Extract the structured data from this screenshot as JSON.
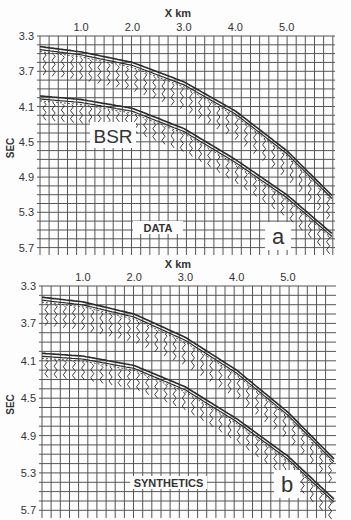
{
  "chart_data": [
    {
      "type": "heatmap",
      "panel_label": "a",
      "annotation": "DATA",
      "feature_label": "BSR",
      "title": "",
      "xlabel": "X km",
      "ylabel": "SEC",
      "x_ticks": [
        "1.0",
        "2.0",
        "3.0",
        "4.0",
        "5.0"
      ],
      "x_tick_values": [
        1.0,
        2.0,
        3.0,
        4.0,
        5.0
      ],
      "y_ticks": [
        "3.3",
        "3.7",
        "4.1",
        "4.5",
        "4.9",
        "5.3",
        "5.7"
      ],
      "y_tick_values": [
        3.3,
        3.7,
        4.1,
        4.5,
        4.9,
        5.3,
        5.7
      ],
      "xlim": [
        0.2,
        5.9
      ],
      "ylim": [
        3.3,
        5.75
      ],
      "grid": true,
      "events": [
        {
          "name": "seafloor reflection",
          "x": [
            0.2,
            1.0,
            2.0,
            3.0,
            4.0,
            5.0,
            5.9
          ],
          "t": [
            3.42,
            3.48,
            3.6,
            3.82,
            4.15,
            4.6,
            5.12
          ]
        },
        {
          "name": "BSR",
          "x": [
            0.2,
            1.0,
            2.0,
            3.0,
            4.0,
            5.0,
            5.9
          ],
          "t": [
            3.98,
            4.02,
            4.12,
            4.35,
            4.7,
            5.1,
            5.55
          ]
        }
      ]
    },
    {
      "type": "heatmap",
      "panel_label": "b",
      "annotation": "SYNTHETICS",
      "title": "",
      "xlabel": "X km",
      "ylabel": "SEC",
      "x_ticks": [
        "1.0",
        "2.0",
        "3.0",
        "4.0",
        "5.0"
      ],
      "x_tick_values": [
        1.0,
        2.0,
        3.0,
        4.0,
        5.0
      ],
      "y_ticks": [
        "3.3",
        "3.7",
        "4.1",
        "4.5",
        "4.9",
        "5.3",
        "5.7"
      ],
      "y_tick_values": [
        3.3,
        3.7,
        4.1,
        4.5,
        4.9,
        5.3,
        5.7
      ],
      "xlim": [
        0.2,
        5.9
      ],
      "ylim": [
        3.3,
        5.75
      ],
      "grid": true,
      "events": [
        {
          "name": "seafloor reflection",
          "x": [
            0.2,
            1.0,
            2.0,
            3.0,
            4.0,
            5.0,
            5.9
          ],
          "t": [
            3.42,
            3.47,
            3.6,
            3.85,
            4.2,
            4.65,
            5.15
          ]
        },
        {
          "name": "BSR",
          "x": [
            0.2,
            1.0,
            2.0,
            3.0,
            4.0,
            5.0,
            5.9
          ],
          "t": [
            4.02,
            4.05,
            4.15,
            4.38,
            4.72,
            5.12,
            5.58
          ]
        }
      ]
    }
  ],
  "panels": [
    {
      "box": {
        "left": 40,
        "top": 36,
        "right": 333,
        "bottom": 252
      },
      "title_pos": {
        "x": 178,
        "y": 17
      },
      "annotation_box": {
        "x": 133,
        "y": 221,
        "w": 50,
        "h": 13
      },
      "label_box": {
        "x": 265,
        "y": 222,
        "w": 26,
        "h": 28
      },
      "feature_box": {
        "x": 90,
        "y": 122,
        "w": 46,
        "h": 26
      }
    },
    {
      "box": {
        "left": 42,
        "top": 286,
        "right": 334,
        "bottom": 515
      },
      "title_pos": {
        "x": 178,
        "y": 268
      },
      "annotation_box": {
        "x": 130,
        "y": 476,
        "w": 77,
        "h": 13
      },
      "label_box": {
        "x": 274,
        "y": 470,
        "w": 26,
        "h": 28
      },
      "feature_box": null
    }
  ],
  "style": {
    "grid_color": "#555555",
    "trace_color": "#2a2a2a",
    "background": "#fdfdfd"
  }
}
